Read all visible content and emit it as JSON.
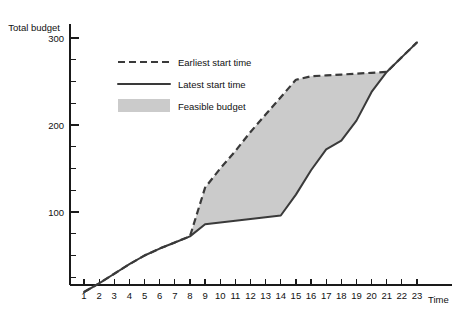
{
  "chart_data": {
    "type": "area",
    "title": "",
    "ylabel": "Total budget",
    "xlabel": "Time",
    "xlim": [
      1,
      23
    ],
    "ylim": [
      0,
      312
    ],
    "grid": false,
    "legend_position": "upper-left-inside",
    "y_ticks_labeled": [
      100,
      200,
      300
    ],
    "y_ticks_minor": [
      25,
      50,
      75,
      125,
      150,
      175,
      225,
      250,
      275
    ],
    "x_ticks": [
      1,
      2,
      3,
      4,
      5,
      6,
      7,
      8,
      9,
      10,
      11,
      12,
      13,
      14,
      15,
      16,
      17,
      18,
      19,
      20,
      21,
      22,
      23
    ],
    "legend": [
      {
        "label": "Earliest start time",
        "style": "dashed",
        "color": "#3a3a3a"
      },
      {
        "label": "Latest start time",
        "style": "solid",
        "color": "#3a3a3a"
      },
      {
        "label": "Feasible budget",
        "style": "fill",
        "color": "#cbcbcb"
      }
    ],
    "series": [
      {
        "name": "Earliest start time",
        "style": "dashed",
        "x": [
          1,
          2,
          3,
          4,
          5,
          6,
          7,
          8,
          9,
          10,
          11,
          12,
          13,
          14,
          15,
          16,
          17,
          18,
          19,
          20,
          21,
          22,
          23
        ],
        "values": [
          8,
          18,
          29,
          40,
          50,
          58,
          65,
          72,
          128,
          150,
          170,
          192,
          212,
          232,
          252,
          256,
          257,
          258,
          259,
          260,
          261,
          278,
          295
        ]
      },
      {
        "name": "Latest start time",
        "style": "solid",
        "x": [
          1,
          2,
          3,
          4,
          5,
          6,
          7,
          8,
          9,
          10,
          11,
          12,
          13,
          14,
          15,
          16,
          17,
          18,
          19,
          20,
          21,
          22,
          23
        ],
        "values": [
          8,
          18,
          29,
          40,
          50,
          58,
          65,
          72,
          86,
          88,
          90,
          92,
          94,
          96,
          120,
          148,
          172,
          182,
          205,
          238,
          261,
          278,
          295
        ]
      }
    ],
    "feasible_region": {
      "name": "Feasible budget",
      "color": "#cbcbcb",
      "upper_series": "Earliest start time",
      "lower_series": "Latest start time",
      "x_start": 8,
      "x_end": 21
    }
  }
}
